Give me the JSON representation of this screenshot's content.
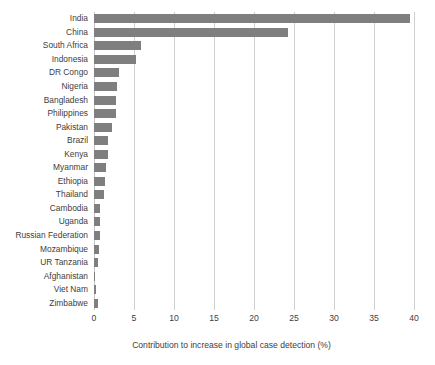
{
  "chart_data": {
    "type": "bar",
    "orientation": "horizontal",
    "title": "",
    "xlabel": "Contribution to increase in global case detection (%)",
    "ylabel": "",
    "xlim": [
      0,
      40
    ],
    "xticks": [
      0,
      5,
      10,
      15,
      20,
      25,
      30,
      35,
      40
    ],
    "grid": "vertical",
    "legend": null,
    "bar_color": "#7f7f7f",
    "categories": [
      "India",
      "China",
      "South Africa",
      "Indonesia",
      "DR Congo",
      "Nigeria",
      "Bangladesh",
      "Philippines",
      "Pakistan",
      "Brazil",
      "Kenya",
      "Myanmar",
      "Ethiopia",
      "Thailand",
      "Cambodia",
      "Uganda",
      "Russian Federation",
      "Mozambique",
      "UR Tanzania",
      "Afghanistan",
      "Viet Nam",
      "Zimbabwe"
    ],
    "values": [
      39.5,
      24.3,
      5.9,
      5.2,
      3.1,
      2.9,
      2.8,
      2.8,
      2.3,
      1.8,
      1.8,
      1.5,
      1.4,
      1.3,
      0.7,
      0.7,
      0.7,
      0.6,
      0.5,
      0.1,
      0.3,
      0.5
    ]
  }
}
